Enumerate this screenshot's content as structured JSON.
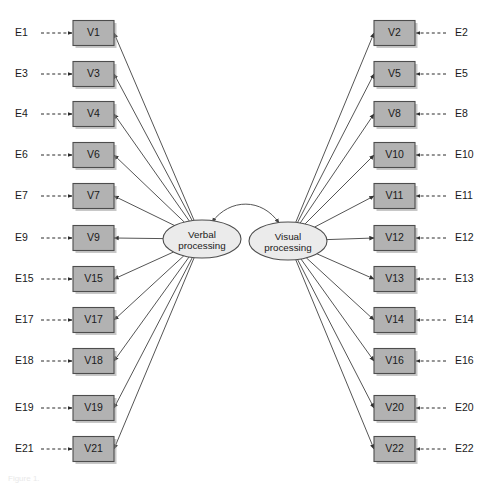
{
  "diagram": {
    "type": "structural-equation-model-path-diagram",
    "background_color": "#ffffff",
    "box_fill_color": "#b2b2b2",
    "box_stroke_color": "#4d4d4d",
    "ellipse_fill_color": "#ebebeb",
    "path_color": "#555555",
    "caption": "Figure 1."
  },
  "factors": {
    "verbal": {
      "id": "verbal-processing",
      "line1": "Verbal",
      "line2": "processing",
      "cx": 202,
      "cy": 239,
      "rx": 39,
      "ry": 19
    },
    "visual": {
      "id": "visual-processing",
      "line1": "Visual",
      "line2": "processing",
      "cx": 288,
      "cy": 241,
      "rx": 39,
      "ry": 19
    }
  },
  "covariance": {
    "name": "verbal-visual-covariance",
    "double_headed": true
  },
  "left_indicators": [
    {
      "variable": "V1",
      "error": "E1",
      "y": 33
    },
    {
      "variable": "V3",
      "error": "E3",
      "y": 74
    },
    {
      "variable": "V4",
      "error": "E4",
      "y": 114
    },
    {
      "variable": "V6",
      "error": "E6",
      "y": 155
    },
    {
      "variable": "V7",
      "error": "E7",
      "y": 196
    },
    {
      "variable": "V9",
      "error": "E9",
      "y": 238
    },
    {
      "variable": "V15",
      "error": "E15",
      "y": 279
    },
    {
      "variable": "V17",
      "error": "E17",
      "y": 320
    },
    {
      "variable": "V18",
      "error": "E18",
      "y": 361
    },
    {
      "variable": "V19",
      "error": "E19",
      "y": 408
    },
    {
      "variable": "V21",
      "error": "E21",
      "y": 449
    }
  ],
  "right_indicators": [
    {
      "variable": "V2",
      "error": "E2",
      "y": 33
    },
    {
      "variable": "V5",
      "error": "E5",
      "y": 74
    },
    {
      "variable": "V8",
      "error": "E8",
      "y": 114
    },
    {
      "variable": "V10",
      "error": "E10",
      "y": 155
    },
    {
      "variable": "V11",
      "error": "E11",
      "y": 196
    },
    {
      "variable": "V12",
      "error": "E12",
      "y": 238
    },
    {
      "variable": "V13",
      "error": "E13",
      "y": 279
    },
    {
      "variable": "V14",
      "error": "E14",
      "y": 320
    },
    {
      "variable": "V16",
      "error": "E16",
      "y": 361
    },
    {
      "variable": "V20",
      "error": "E20",
      "y": 408
    },
    {
      "variable": "V22",
      "error": "E22",
      "y": 449
    }
  ],
  "geometry": {
    "box_width": 41,
    "box_height": 25,
    "left_box_x": 73,
    "right_box_x": 374,
    "left_error_label_x": 15,
    "right_error_label_x": 455,
    "left_dash_start": 41,
    "right_dash_start": 446
  }
}
